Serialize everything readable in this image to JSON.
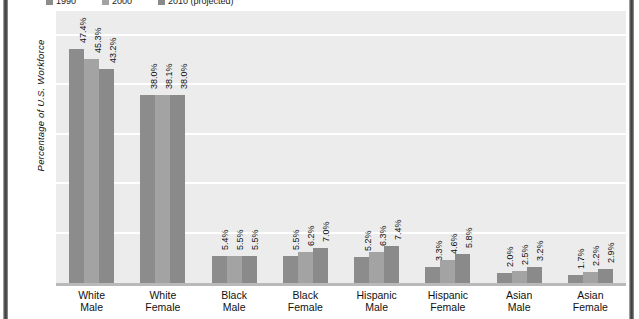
{
  "chart_data": {
    "type": "bar",
    "title": "",
    "xlabel": "",
    "ylabel": "Percentage of U.S. Workforce",
    "ylim": [
      0,
      55
    ],
    "yticks": [
      10,
      20,
      30,
      40,
      50
    ],
    "grid": true,
    "legend_position": "top",
    "categories": [
      "White Male",
      "White Female",
      "Black Male",
      "Black Female",
      "Hispanic Male",
      "Hispanic Female",
      "Asian Male",
      "Asian Female"
    ],
    "series": [
      {
        "name": "1990",
        "color": "#8c8c8c",
        "values": [
          47.4,
          38.0,
          5.4,
          5.5,
          5.2,
          3.3,
          2.0,
          1.7
        ],
        "labels": [
          "47.4%",
          "38.0%",
          "5.4%",
          "5.5%",
          "5.2%",
          "3.3%",
          "2.0%",
          "1.7%"
        ]
      },
      {
        "name": "2000",
        "color": "#a3a3a3",
        "values": [
          45.3,
          38.1,
          5.5,
          6.2,
          6.3,
          4.6,
          2.5,
          2.2
        ],
        "labels": [
          "45.3%",
          "38.1%",
          "5.5%",
          "6.2%",
          "6.3%",
          "4.6%",
          "2.5%",
          "2.2%"
        ]
      },
      {
        "name": "2010 (projected)",
        "color": "#8a8a8a",
        "values": [
          43.2,
          38.0,
          5.5,
          7.0,
          7.4,
          5.8,
          3.2,
          2.9
        ],
        "labels": [
          "43.2%",
          "38.0%",
          "5.5%",
          "7.0%",
          "7.4%",
          "5.8%",
          "3.2%",
          "2.9%"
        ]
      }
    ]
  },
  "categories_lines": [
    [
      "White",
      "Male"
    ],
    [
      "White",
      "Female"
    ],
    [
      "Black",
      "Male"
    ],
    [
      "Black",
      "Female"
    ],
    [
      "Hispanic",
      "Male"
    ],
    [
      "Hispanic",
      "Female"
    ],
    [
      "Asian",
      "Male"
    ],
    [
      "Asian",
      "Female"
    ]
  ],
  "colors": {
    "plot_background": "#ececed",
    "gridline": "#ffffff",
    "baseline": "#b9b9b9",
    "text": "#111111",
    "edge_rail": "#3c3c3c"
  }
}
